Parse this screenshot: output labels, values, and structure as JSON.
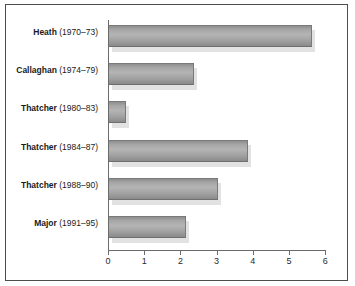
{
  "chart_data": {
    "type": "bar",
    "orientation": "horizontal",
    "title": "",
    "xlabel": "",
    "ylabel": "",
    "xlim": [
      0,
      6
    ],
    "xticks": [
      0,
      1,
      2,
      3,
      4,
      5,
      6
    ],
    "xtick_labels": [
      "0",
      "1",
      "2",
      "3",
      "4",
      "5",
      "6"
    ],
    "grid": false,
    "legend": null,
    "categories": [
      "Heath (1970–73)",
      "Callaghan (1974–79)",
      "Thatcher (1980–83)",
      "Thatcher (1984–87)",
      "Thatcher (1988–90)",
      "Major (1991–95)"
    ],
    "category_parts": [
      {
        "name": "Heath",
        "years": "(1970–73)"
      },
      {
        "name": "Callaghan",
        "years": "(1974–79)"
      },
      {
        "name": "Thatcher",
        "years": "(1980–83)"
      },
      {
        "name": "Thatcher",
        "years": "(1984–87)"
      },
      {
        "name": "Thatcher",
        "years": "(1988–90)"
      },
      {
        "name": "Major",
        "years": "(1991–95)"
      }
    ],
    "values": [
      5.6,
      2.35,
      0.47,
      3.85,
      3.0,
      2.13
    ],
    "bar_color": "#a6a6a6",
    "bar_edge_color": "#7a7a7a",
    "shadow_color": "#e2e2e2",
    "axis_color": "#6b6b6b",
    "frame_color": "#4d4d4d",
    "background_color": "#ffffff",
    "text_color": "#1a1a1a"
  }
}
